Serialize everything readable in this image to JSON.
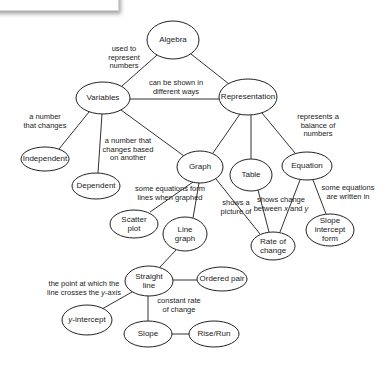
{
  "diagram": {
    "type": "concept-map",
    "colors": {
      "stroke": "#222222",
      "background": "#ffffff",
      "text": "#222222"
    },
    "nodes": [
      {
        "id": "algebra",
        "label": [
          "Algebra"
        ],
        "cx": 173,
        "cy": 40,
        "rx": 26,
        "ry": 19
      },
      {
        "id": "variables",
        "label": [
          "Variables"
        ],
        "cx": 103,
        "cy": 98,
        "rx": 27,
        "ry": 16
      },
      {
        "id": "representation",
        "label": [
          "Representation"
        ],
        "cx": 248,
        "cy": 97,
        "rx": 29,
        "ry": 18
      },
      {
        "id": "independent",
        "label": [
          "Independent"
        ],
        "cx": 45,
        "cy": 159,
        "rx": 24,
        "ry": 12
      },
      {
        "id": "dependent",
        "label": [
          "Dependent"
        ],
        "cx": 96,
        "cy": 186,
        "rx": 24,
        "ry": 13
      },
      {
        "id": "graph",
        "label": [
          "Graph"
        ],
        "cx": 200,
        "cy": 167,
        "rx": 23,
        "ry": 16
      },
      {
        "id": "table",
        "label": [
          "Table"
        ],
        "cx": 251,
        "cy": 175,
        "rx": 21,
        "ry": 16
      },
      {
        "id": "equation",
        "label": [
          "Equation"
        ],
        "cx": 307,
        "cy": 166,
        "rx": 25,
        "ry": 14
      },
      {
        "id": "scatter-plot",
        "label": [
          "Scatter",
          "plot"
        ],
        "cx": 134,
        "cy": 224,
        "rx": 24,
        "ry": 14
      },
      {
        "id": "line-graph",
        "label": [
          "Line",
          "graph"
        ],
        "cx": 185,
        "cy": 234,
        "rx": 22,
        "ry": 17
      },
      {
        "id": "rate-of-change",
        "label": [
          "Rate of",
          "change"
        ],
        "cx": 273,
        "cy": 246,
        "rx": 22,
        "ry": 14
      },
      {
        "id": "slope-intercept-form",
        "label": [
          "Slope",
          "intercept",
          "form"
        ],
        "cx": 330,
        "cy": 230,
        "rx": 24,
        "ry": 16
      },
      {
        "id": "straight-line",
        "label": [
          "Straight",
          "line"
        ],
        "cx": 149,
        "cy": 281,
        "rx": 24,
        "ry": 15
      },
      {
        "id": "ordered-pair",
        "label": [
          "Ordered pair"
        ],
        "cx": 222,
        "cy": 279,
        "rx": 25,
        "ry": 12
      },
      {
        "id": "y-intercept",
        "label": [
          "y-intercept"
        ],
        "cx": 87,
        "cy": 320,
        "rx": 25,
        "ry": 15
      },
      {
        "id": "slope",
        "label": [
          "Slope"
        ],
        "cx": 148,
        "cy": 334,
        "rx": 24,
        "ry": 13
      },
      {
        "id": "rise-run",
        "label": [
          "Rise/Run"
        ],
        "cx": 214,
        "cy": 334,
        "rx": 25,
        "ry": 13
      }
    ],
    "edges": [
      {
        "id": "algebra-variables",
        "x1": 157,
        "y1": 55,
        "x2": 122,
        "y2": 86
      },
      {
        "id": "algebra-representation",
        "x1": 191,
        "y1": 54,
        "x2": 229,
        "y2": 84
      },
      {
        "id": "variables-representation",
        "x1": 130,
        "y1": 99,
        "x2": 219,
        "y2": 99
      },
      {
        "id": "variables-independent",
        "x1": 89,
        "y1": 112,
        "x2": 59,
        "y2": 149
      },
      {
        "id": "variables-dependent",
        "x1": 102,
        "y1": 114,
        "x2": 98,
        "y2": 173
      },
      {
        "id": "variables-graph",
        "x1": 121,
        "y1": 110,
        "x2": 184,
        "y2": 156
      },
      {
        "id": "representation-graph",
        "x1": 240,
        "y1": 114,
        "x2": 213,
        "y2": 153
      },
      {
        "id": "representation-table",
        "x1": 251,
        "y1": 115,
        "x2": 251,
        "y2": 159
      },
      {
        "id": "representation-equation",
        "x1": 262,
        "y1": 113,
        "x2": 295,
        "y2": 153
      },
      {
        "id": "graph-scatter",
        "x1": 193,
        "y1": 182,
        "x2": 150,
        "y2": 212
      },
      {
        "id": "graph-linegraph",
        "x1": 199,
        "y1": 183,
        "x2": 193,
        "y2": 218
      },
      {
        "id": "graph-rate",
        "x1": 216,
        "y1": 179,
        "x2": 260,
        "y2": 234
      },
      {
        "id": "table-rate",
        "x1": 258,
        "y1": 190,
        "x2": 269,
        "y2": 232
      },
      {
        "id": "equation-rate",
        "x1": 300,
        "y1": 180,
        "x2": 280,
        "y2": 232
      },
      {
        "id": "equation-slopeintercept",
        "x1": 313,
        "y1": 180,
        "x2": 326,
        "y2": 214
      },
      {
        "id": "linegraph-straightline",
        "x1": 176,
        "y1": 250,
        "x2": 160,
        "y2": 267
      },
      {
        "id": "straightline-orderedpair",
        "x1": 173,
        "y1": 280,
        "x2": 197,
        "y2": 280
      },
      {
        "id": "straightline-yintercept",
        "x1": 132,
        "y1": 292,
        "x2": 102,
        "y2": 309
      },
      {
        "id": "straightline-slope",
        "x1": 148,
        "y1": 296,
        "x2": 148,
        "y2": 321
      },
      {
        "id": "slope-riserun",
        "x1": 172,
        "y1": 334,
        "x2": 189,
        "y2": 334
      }
    ],
    "link_labels": [
      {
        "id": "used-to-represent",
        "lines": [
          "used to",
          "represent",
          "numbers"
        ],
        "x": 124,
        "y": 51
      },
      {
        "id": "can-be-shown",
        "lines": [
          "can be shown in",
          "different ways"
        ],
        "x": 176,
        "y": 85
      },
      {
        "id": "a-number-that-changes",
        "lines": [
          "a number",
          "that changes"
        ],
        "x": 45,
        "y": 119
      },
      {
        "id": "changes-based-on-another",
        "lines": [
          "a number that",
          "changes based",
          "on another"
        ],
        "x": 128,
        "y": 143
      },
      {
        "id": "represents-balance",
        "lines": [
          "represents a",
          "balance of",
          "numbers"
        ],
        "x": 318,
        "y": 119
      },
      {
        "id": "some-equations-form-lines",
        "lines": [
          "some equations form",
          "lines when graphed"
        ],
        "x": 170,
        "y": 191
      },
      {
        "id": "shows-a-picture-of",
        "lines": [
          "shows a",
          "picture of"
        ],
        "x": 236,
        "y": 205
      },
      {
        "id": "shows-change-between",
        "lines": [
          "shows change",
          "between x and y"
        ],
        "x": 281,
        "y": 202
      },
      {
        "id": "some-equations-written",
        "lines": [
          "some equations",
          "are written in"
        ],
        "x": 348,
        "y": 190
      },
      {
        "id": "point-crosses-y-axis",
        "lines": [
          "the point at which the",
          "line crosses the y-axis"
        ],
        "x": 84,
        "y": 286
      },
      {
        "id": "constant-rate",
        "lines": [
          "constant rate",
          "of change"
        ],
        "x": 179,
        "y": 303
      }
    ]
  }
}
